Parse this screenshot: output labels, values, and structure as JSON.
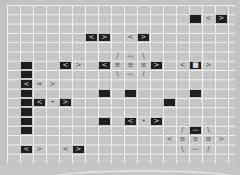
{
  "board": {
    "columns": 18,
    "rows": 17,
    "cell_width": 13,
    "cell_height": 9.3,
    "colors": {
      "background": "#c6c6c6",
      "grid_line": "#efefef",
      "dark_cell": "#1f1f1f",
      "glyph_on_dark": "#d8d8d8",
      "glyph_plain": "#555555"
    },
    "cells": [
      {
        "r": 1,
        "c": 14,
        "type": "dark",
        "glyph": ""
      },
      {
        "r": 1,
        "c": 15,
        "type": "plain",
        "glyph": "<"
      },
      {
        "r": 1,
        "c": 16,
        "type": "dark",
        "glyph": ">"
      },
      {
        "r": 3,
        "c": 6,
        "type": "dark",
        "glyph": "<"
      },
      {
        "r": 3,
        "c": 7,
        "type": "dark",
        "glyph": ">"
      },
      {
        "r": 3,
        "c": 9,
        "type": "plain",
        "glyph": "<"
      },
      {
        "r": 3,
        "c": 10,
        "type": "dark",
        "glyph": ">"
      },
      {
        "r": 5,
        "c": 8,
        "type": "plain",
        "glyph": "/"
      },
      {
        "r": 5,
        "c": 9,
        "type": "plain",
        "glyph": "—"
      },
      {
        "r": 5,
        "c": 10,
        "type": "plain",
        "glyph": "\\"
      },
      {
        "r": 6,
        "c": 1,
        "type": "dark",
        "glyph": ""
      },
      {
        "r": 6,
        "c": 4,
        "type": "dark",
        "glyph": "<"
      },
      {
        "r": 6,
        "c": 5,
        "type": "plain",
        "glyph": ">"
      },
      {
        "r": 6,
        "c": 7,
        "type": "dark",
        "glyph": "<"
      },
      {
        "r": 6,
        "c": 8,
        "type": "plain",
        "glyph": "≡"
      },
      {
        "r": 6,
        "c": 9,
        "type": "plain",
        "glyph": "≡"
      },
      {
        "r": 6,
        "c": 10,
        "type": "plain",
        "glyph": "≡"
      },
      {
        "r": 6,
        "c": 11,
        "type": "dark",
        "glyph": ">"
      },
      {
        "r": 6,
        "c": 13,
        "type": "plain",
        "glyph": "<"
      },
      {
        "r": 6,
        "c": 14,
        "type": "dark",
        "glyph": "■"
      },
      {
        "r": 6,
        "c": 15,
        "type": "plain",
        "glyph": ">"
      },
      {
        "r": 7,
        "c": 1,
        "type": "dark",
        "glyph": ""
      },
      {
        "r": 7,
        "c": 8,
        "type": "plain",
        "glyph": "\\"
      },
      {
        "r": 7,
        "c": 9,
        "type": "plain",
        "glyph": "—"
      },
      {
        "r": 7,
        "c": 10,
        "type": "plain",
        "glyph": "/"
      },
      {
        "r": 8,
        "c": 1,
        "type": "dark",
        "glyph": "<"
      },
      {
        "r": 8,
        "c": 2,
        "type": "plain",
        "glyph": "="
      },
      {
        "r": 8,
        "c": 3,
        "type": "plain",
        "glyph": ">"
      },
      {
        "r": 9,
        "c": 1,
        "type": "dark",
        "glyph": ""
      },
      {
        "r": 9,
        "c": 7,
        "type": "dark",
        "glyph": ""
      },
      {
        "r": 9,
        "c": 9,
        "type": "dark",
        "glyph": ""
      },
      {
        "r": 9,
        "c": 14,
        "type": "dark",
        "glyph": ""
      },
      {
        "r": 10,
        "c": 1,
        "type": "dark",
        "glyph": ""
      },
      {
        "r": 10,
        "c": 2,
        "type": "dark",
        "glyph": "<"
      },
      {
        "r": 10,
        "c": 3,
        "type": "plain",
        "glyph": "•"
      },
      {
        "r": 10,
        "c": 4,
        "type": "dark",
        "glyph": ">"
      },
      {
        "r": 10,
        "c": 12,
        "type": "dark",
        "glyph": ""
      },
      {
        "r": 11,
        "c": 1,
        "type": "dark",
        "glyph": ""
      },
      {
        "r": 12,
        "c": 1,
        "type": "dark",
        "glyph": ""
      },
      {
        "r": 12,
        "c": 7,
        "type": "dark",
        "glyph": ""
      },
      {
        "r": 12,
        "c": 9,
        "type": "dark",
        "glyph": "<"
      },
      {
        "r": 12,
        "c": 10,
        "type": "plain",
        "glyph": "•"
      },
      {
        "r": 12,
        "c": 11,
        "type": "dark",
        "glyph": ">"
      },
      {
        "r": 13,
        "c": 1,
        "type": "dark",
        "glyph": ""
      },
      {
        "r": 13,
        "c": 13,
        "type": "plain",
        "glyph": "/"
      },
      {
        "r": 13,
        "c": 14,
        "type": "dark",
        "glyph": "—"
      },
      {
        "r": 13,
        "c": 15,
        "type": "plain",
        "glyph": "\\"
      },
      {
        "r": 14,
        "c": 12,
        "type": "plain",
        "glyph": "<"
      },
      {
        "r": 14,
        "c": 13,
        "type": "plain",
        "glyph": "≡"
      },
      {
        "r": 14,
        "c": 14,
        "type": "plain",
        "glyph": "≡"
      },
      {
        "r": 14,
        "c": 15,
        "type": "plain",
        "glyph": "≡"
      },
      {
        "r": 14,
        "c": 16,
        "type": "plain",
        "glyph": ">"
      },
      {
        "r": 15,
        "c": 1,
        "type": "dark",
        "glyph": "<"
      },
      {
        "r": 15,
        "c": 2,
        "type": "plain",
        "glyph": ">"
      },
      {
        "r": 15,
        "c": 4,
        "type": "plain",
        "glyph": "<"
      },
      {
        "r": 15,
        "c": 5,
        "type": "dark",
        "glyph": ">"
      },
      {
        "r": 15,
        "c": 13,
        "type": "plain",
        "glyph": "\\"
      },
      {
        "r": 15,
        "c": 14,
        "type": "plain",
        "glyph": "—"
      },
      {
        "r": 15,
        "c": 15,
        "type": "plain",
        "glyph": "/"
      }
    ]
  }
}
